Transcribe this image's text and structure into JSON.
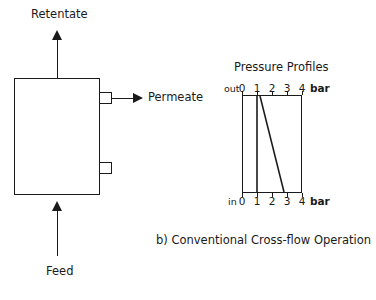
{
  "figure": {
    "caption": "b) Conventional Cross-flow Operation"
  },
  "module": {
    "retentate_label": "Retentate",
    "feed_label": "Feed",
    "permeate_label": "Permeate",
    "ports": [
      {
        "name": "permeate-port",
        "label": "Permeate"
      },
      {
        "name": "lower-port",
        "label": ""
      }
    ]
  },
  "chart_data": {
    "type": "line",
    "title": "Pressure Profiles",
    "xlabel": "bar",
    "ylabel": "",
    "unit": "bar",
    "orientation": "vertical-position-axis",
    "xlim": [
      0,
      4
    ],
    "ylim": [
      0,
      1
    ],
    "grid": false,
    "legend": null,
    "x_ticks": [
      0,
      1,
      2,
      3,
      4
    ],
    "x_tick_labels": [
      "0",
      "1",
      "2",
      "3",
      "4"
    ],
    "top_axis_name": "out",
    "bottom_axis_name": "in",
    "top_unit_label": "bar",
    "bottom_unit_label": "bar",
    "series": [
      {
        "name": "permeate-pressure",
        "points": [
          {
            "position": "out",
            "pressure": 1.0
          },
          {
            "position": "in",
            "pressure": 1.0
          }
        ]
      },
      {
        "name": "feed-retentate-pressure",
        "points": [
          {
            "position": "out",
            "pressure": 1.2
          },
          {
            "position": "in",
            "pressure": 2.8
          }
        ]
      }
    ]
  }
}
